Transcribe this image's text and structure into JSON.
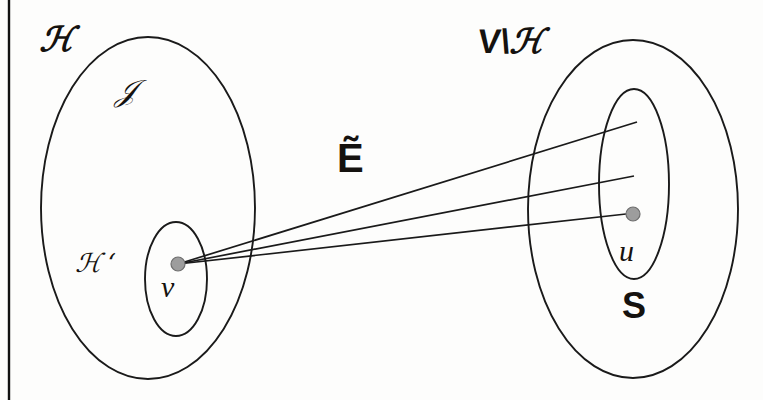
{
  "figure": {
    "kind": "set-diagram",
    "background_color": "#fdfdfc",
    "ink_color": "#1a1a1a",
    "node_fill_color": "#9d9d9d",
    "node_stroke_color": "#6e6e6e",
    "border": {
      "side": "left",
      "color": "#111111"
    }
  },
  "labels": {
    "left_outer_set": "ℋ",
    "left_region": "𝒥",
    "left_inner_set": "ℋ ‘",
    "left_node": "v",
    "edges_label": "Ẽ",
    "right_outer_set_prefix": "V\\",
    "right_outer_set_suffix": "ℋ",
    "right_inner_set": "S",
    "right_node": "u"
  },
  "shapes": {
    "left_outer_ellipse": {
      "cx": 148,
      "cy": 208,
      "rx": 107,
      "ry": 171
    },
    "left_inner_ellipse": {
      "cx": 176,
      "cy": 279,
      "rx": 31,
      "ry": 57
    },
    "right_outer_ellipse": {
      "cx": 633,
      "cy": 209,
      "rx": 105,
      "ry": 169
    },
    "right_inner_ellipse": {
      "cx": 634,
      "cy": 184,
      "rx": 35,
      "ry": 95
    }
  },
  "nodes": [
    {
      "name": "v",
      "cx": 178,
      "cy": 264,
      "r": 7
    },
    {
      "name": "u",
      "cx": 633,
      "cy": 214,
      "r": 7
    }
  ],
  "edges": [
    {
      "from": "v",
      "x1": 178,
      "y1": 264,
      "x2": 637,
      "y2": 122
    },
    {
      "from": "v",
      "x1": 178,
      "y1": 264,
      "x2": 634,
      "y2": 176
    },
    {
      "from": "v",
      "x1": 178,
      "y1": 264,
      "x2": 626,
      "y2": 214
    }
  ]
}
